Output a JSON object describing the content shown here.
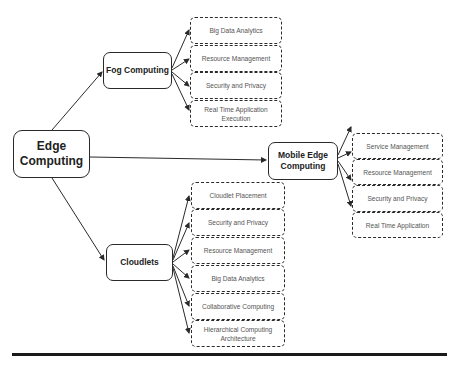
{
  "diagram": {
    "root": {
      "label": "Edge Computing"
    },
    "branches": [
      {
        "label": "Fog Computing",
        "children": [
          "Big Data Analytics",
          "Resource Management",
          "Security and Privacy",
          "Real Time Application Execution"
        ]
      },
      {
        "label": "Mobile Edge Computing",
        "children": [
          "Service Management",
          "Resource Management",
          "Security and Privacy",
          "Real Time Application"
        ]
      },
      {
        "label": "Cloudlets",
        "children": [
          "Cloudlet Placement",
          "Security and Privacy",
          "Resource Management",
          "Big Data Analytics",
          "Collaborative Computing",
          "Hierarchical Computing Architecture"
        ]
      }
    ],
    "colors": {
      "stroke": "#2a2a2a",
      "text": "#222222",
      "leaf_text": "#555555",
      "background": "#ffffff"
    }
  }
}
